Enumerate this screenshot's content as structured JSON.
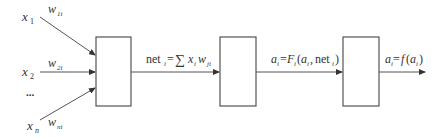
{
  "diagram": {
    "type": "neuron-processing-flow",
    "inputs": [
      {
        "var": "x",
        "sub": "1",
        "weight": "w",
        "wsub": "1i"
      },
      {
        "var": "x",
        "sub": "2",
        "weight": "w",
        "wsub": "2i"
      },
      {
        "ellipsis": "..."
      },
      {
        "var": "x",
        "sub": "n",
        "weight": "w",
        "wsub": "ni"
      }
    ],
    "blocks": [
      {
        "id": "block-1",
        "label": ""
      },
      {
        "id": "block-2",
        "label": ""
      },
      {
        "id": "block-3",
        "label": ""
      }
    ],
    "edges": [
      {
        "from": "block-1",
        "to": "block-2",
        "label": "net_i = Σ x_i w_ji"
      },
      {
        "from": "block-2",
        "to": "block-3",
        "label": "a_i = F_i(a_i, net_i)"
      },
      {
        "from": "block-3",
        "to": "output",
        "label": "a_i = f(a_i)"
      }
    ],
    "text": {
      "x": "x",
      "w": "w",
      "s1": "1",
      "s2": "2",
      "sn": "n",
      "w1": "1i",
      "w2": "2i",
      "wn": "ni",
      "dots": "...",
      "net": "net",
      "i": "i",
      "eq": "=",
      "sigma": "∑",
      "ji": "ji",
      "a": "a",
      "F": "F",
      "f": "f",
      "lp": "(",
      "rp": ")",
      "comma": ",",
      "ji_x": "x"
    },
    "colors": {
      "stroke": "#555555",
      "text": "#333333",
      "background": "#ffffff"
    }
  }
}
